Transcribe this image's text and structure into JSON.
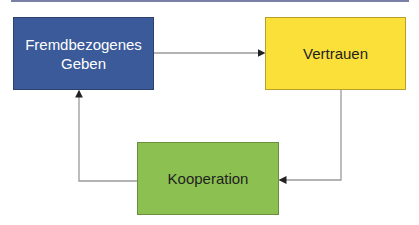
{
  "diagram": {
    "type": "cycle-flow",
    "nodes": [
      {
        "id": "fremdbezogenes-geben",
        "label": "Fremdbezogenes Geben",
        "color": "#3a5a9a"
      },
      {
        "id": "vertrauen",
        "label": "Vertrauen",
        "color": "#fbe03a"
      },
      {
        "id": "kooperation",
        "label": "Kooperation",
        "color": "#8cc152"
      }
    ],
    "edges": [
      {
        "from": "fremdbezogenes-geben",
        "to": "vertrauen"
      },
      {
        "from": "vertrauen",
        "to": "kooperation"
      },
      {
        "from": "kooperation",
        "to": "fremdbezogenes-geben"
      }
    ],
    "connector_color": "#9a9a9a"
  }
}
